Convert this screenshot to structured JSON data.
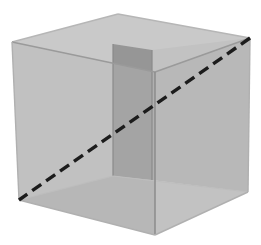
{
  "figure": {
    "title": "Transparent cube with space diagonal",
    "background_color": "#ffffff",
    "canvas": {
      "width": 261,
      "height": 245
    }
  },
  "palette": {
    "top_face": "#c9c9c9",
    "left_face": "#a9a9a9",
    "right_face": "#b1b1b1",
    "back_wall": "#969696",
    "interior_floor": "#dcdcdc",
    "interior_right_wall": "#c2c2c2",
    "edge_stroke": "#8e8e8e",
    "edge_stroke_soft": "#b6b6b6",
    "diagonal_stroke": "#1c1c1c"
  },
  "vertices": {
    "front_top_left": {
      "label": "A",
      "x": 12,
      "y": 42
    },
    "back_top_left": {
      "label": "B",
      "x": 118,
      "y": 14
    },
    "back_top_right": {
      "label": "C",
      "x": 250,
      "y": 38
    },
    "front_top_right": {
      "label": "D",
      "x": 155,
      "y": 72
    },
    "front_bot_left": {
      "label": "E",
      "x": 19,
      "y": 200
    },
    "front_bot_right": {
      "label": "F",
      "x": 155,
      "y": 235
    },
    "back_bot_right": {
      "label": "G",
      "x": 248,
      "y": 192
    },
    "back_bot_left": {
      "label": "H",
      "x": 113,
      "y": 176
    },
    "inner_back_left": {
      "label": "I",
      "x": 113,
      "y": 44
    },
    "inner_back_right": {
      "label": "J",
      "x": 152,
      "y": 50
    }
  },
  "faces": [
    {
      "name": "top-face",
      "points": "12,42 118,14 250,38 155,72",
      "fill": "#c9c9c9"
    },
    {
      "name": "left-face",
      "points": "12,42 155,72 155,235 19,200",
      "fill": "#a9a9a9"
    },
    {
      "name": "right-face",
      "points": "155,72 250,38 248,192 155,235",
      "fill": "#b1b1b1"
    },
    {
      "name": "interior-back-wall",
      "points": "113,44 152,50 152,180 113,176",
      "fill": "#969696"
    },
    {
      "name": "interior-floor",
      "points": "19,200 113,176 248,192 155,235",
      "fill": "#dcdcdc"
    },
    {
      "name": "interior-right-wall",
      "points": "152,50 250,38 248,192 152,180",
      "fill": "#c2c2c2"
    }
  ],
  "edges": [
    {
      "name": "edge-top-front-left",
      "from": "12,42",
      "to": "118,14",
      "style": "solid",
      "width": 1.4,
      "color": "#b6b6b6"
    },
    {
      "name": "edge-top-back-right",
      "from": "118,14",
      "to": "250,38",
      "style": "solid",
      "width": 1.4,
      "color": "#b6b6b6"
    },
    {
      "name": "edge-top-front-right",
      "from": "250,38",
      "to": "155,72",
      "style": "solid",
      "width": 1.4,
      "color": "#9a9a9a"
    },
    {
      "name": "edge-top-left-front",
      "from": "155,72",
      "to": "12,42",
      "style": "solid",
      "width": 1.4,
      "color": "#9a9a9a"
    },
    {
      "name": "edge-vertical-front",
      "from": "155,72",
      "to": "155,235",
      "style": "solid",
      "width": 1.6,
      "color": "#8e8e8e"
    },
    {
      "name": "edge-vertical-left",
      "from": "12,42",
      "to": "19,200",
      "style": "solid",
      "width": 1.4,
      "color": "#b0b0b0"
    },
    {
      "name": "edge-vertical-right",
      "from": "250,38",
      "to": "248,192",
      "style": "solid",
      "width": 1.4,
      "color": "#b0b0b0"
    },
    {
      "name": "edge-bottom-left",
      "from": "19,200",
      "to": "155,235",
      "style": "solid",
      "width": 1.4,
      "color": "#b0b0b0"
    },
    {
      "name": "edge-bottom-right",
      "from": "155,235",
      "to": "248,192",
      "style": "solid",
      "width": 1.4,
      "color": "#b0b0b0"
    },
    {
      "name": "edge-inner-vert-left",
      "from": "113,44",
      "to": "113,176",
      "style": "solid",
      "width": 1.2,
      "color": "#8a8a8a"
    },
    {
      "name": "edge-inner-vert-right",
      "from": "152,50",
      "to": "152,180",
      "style": "solid",
      "width": 1.2,
      "color": "#8a8a8a"
    },
    {
      "name": "edge-floor-back-left",
      "from": "19,200",
      "to": "113,176",
      "style": "solid",
      "width": 1.2,
      "color": "#bdbdbd"
    },
    {
      "name": "edge-floor-back-right",
      "from": "113,176",
      "to": "248,192",
      "style": "solid",
      "width": 1.2,
      "color": "#bdbdbd"
    }
  ],
  "space_diagonal": {
    "name": "space-diagonal",
    "from_vertex": "back_top_right",
    "to_vertex": "front_bot_left",
    "from": "250,38",
    "to": "19,200",
    "style": "dashed",
    "dash_length": 11,
    "gap_length": 6,
    "stroke_width": 3.4,
    "color": "#1c1c1c"
  }
}
